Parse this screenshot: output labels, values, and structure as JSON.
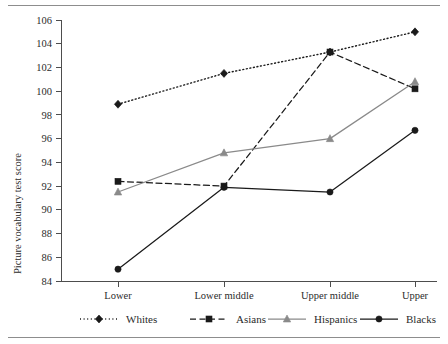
{
  "chart_data": {
    "type": "line",
    "title": "",
    "xlabel": "",
    "ylabel": "Picture vocabulary test score",
    "categories": [
      "Lower",
      "Lower middle",
      "Upper middle",
      "Upper"
    ],
    "ylim": [
      84,
      106
    ],
    "ytick_step": 2,
    "yticks": [
      84,
      86,
      88,
      90,
      92,
      94,
      96,
      98,
      100,
      102,
      104,
      106
    ],
    "grid": false,
    "legend_position": "bottom",
    "series": [
      {
        "name": "Whites",
        "values": [
          98.9,
          101.5,
          103.3,
          105.0
        ],
        "line_style": "dotted",
        "marker": "diamond",
        "color": "#1a1a1a"
      },
      {
        "name": "Asians",
        "values": [
          92.4,
          92.0,
          103.3,
          100.2
        ],
        "line_style": "dashed",
        "marker": "square",
        "color": "#1a1a1a"
      },
      {
        "name": "Hispanics",
        "values": [
          91.5,
          94.8,
          96.0,
          100.8
        ],
        "line_style": "solid",
        "marker": "triangle",
        "color": "#8a8a8a"
      },
      {
        "name": "Blacks",
        "values": [
          85.0,
          91.9,
          91.5,
          96.7
        ],
        "line_style": "solid",
        "marker": "circle",
        "color": "#1a1a1a"
      }
    ]
  },
  "axis": {
    "y_title": "Picture vocabulary test score",
    "y_tick_labels": [
      "106",
      "104",
      "102",
      "100",
      "98",
      "96",
      "94",
      "92",
      "90",
      "88",
      "86",
      "84"
    ],
    "x_tick_labels": [
      "Lower",
      "Lower middle",
      "Upper middle",
      "Upper"
    ]
  },
  "legend": {
    "entries": [
      {
        "label": "Whites",
        "marker_icon": "diamond-marker-icon",
        "line_icon": "dotted-line-icon"
      },
      {
        "label": "Asians",
        "marker_icon": "square-marker-icon",
        "line_icon": "dashed-line-icon"
      },
      {
        "label": "Hispanics",
        "marker_icon": "triangle-marker-icon",
        "line_icon": "solid-gray-line-icon"
      },
      {
        "label": "Blacks",
        "marker_icon": "circle-marker-icon",
        "line_icon": "solid-black-line-icon"
      }
    ]
  }
}
